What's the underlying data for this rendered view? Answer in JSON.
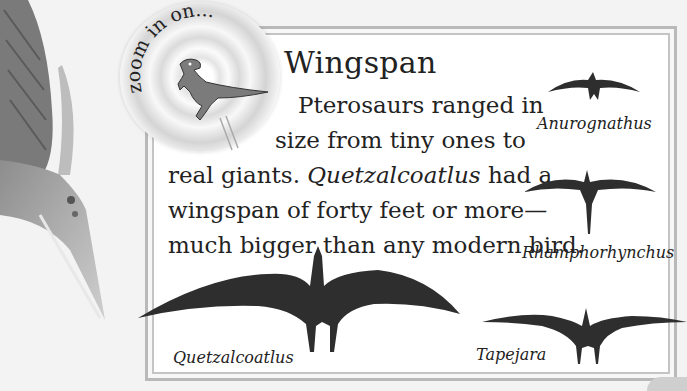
{
  "badge": {
    "text": "zoom in on...",
    "icon": "dinosaur-icon"
  },
  "heading": {
    "title": "Wingspan"
  },
  "paragraph": {
    "line1": "Pterosaurs ranged in",
    "line2": "size from tiny ones to",
    "line3_pre": "real giants. ",
    "line3_italic": "Quetzalcoatlus",
    "line3_post": " had a",
    "line4": "wingspan of forty feet or more—",
    "line5": "much bigger than any modern bird."
  },
  "pterosaurs": [
    {
      "name": "Anurognathus",
      "size": "small"
    },
    {
      "name": "Rhamphorhynchus",
      "size": "medium"
    },
    {
      "name": "Quetzalcoatlus",
      "size": "giant"
    },
    {
      "name": "Tapejara",
      "size": "medium-large"
    }
  ],
  "colors": {
    "silhouette": "#2e2e2e",
    "frame": "#b9b9b9",
    "background": "#f3f3f3"
  }
}
